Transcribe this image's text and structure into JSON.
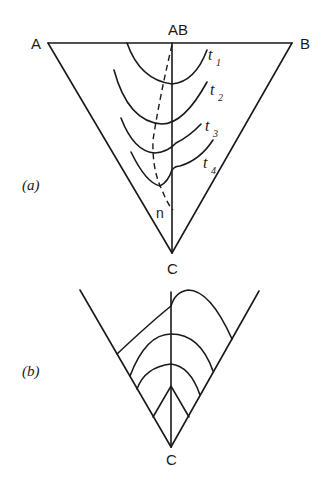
{
  "figure_a": {
    "panel_label": "(a)",
    "vertices": {
      "left": "A",
      "right": "B",
      "bottom": "C",
      "top_midpoint": "AB"
    },
    "isotherms": [
      {
        "label": "t",
        "sub": "1"
      },
      {
        "label": "t",
        "sub": "2"
      },
      {
        "label": "t",
        "sub": "3"
      },
      {
        "label": "t",
        "sub": "4"
      }
    ],
    "dashed_line_label": "n"
  },
  "figure_b": {
    "panel_label": "(b)",
    "bottom_vertex": "C"
  }
}
